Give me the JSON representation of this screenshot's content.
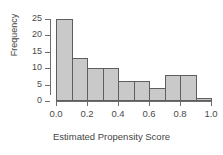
{
  "chart_data": {
    "type": "bar",
    "title": "",
    "subtitle": "",
    "xlabel": "Estimated Propensity Score",
    "ylabel": "Frequency",
    "grid": false,
    "legend": false,
    "legend_position": "none",
    "bin_width": 0.1,
    "bin_edges": [
      0.0,
      0.1,
      0.2,
      0.3,
      0.4,
      0.5,
      0.6,
      0.7,
      0.8,
      0.9,
      1.0
    ],
    "bin_centers": [
      0.05,
      0.15,
      0.25,
      0.35,
      0.45,
      0.55,
      0.65,
      0.75,
      0.85,
      0.95
    ],
    "categories": [
      "0.0-0.1",
      "0.1-0.2",
      "0.2-0.3",
      "0.3-0.4",
      "0.4-0.5",
      "0.5-0.6",
      "0.6-0.7",
      "0.7-0.8",
      "0.8-0.9",
      "0.9-1.0"
    ],
    "values": [
      25,
      13,
      10,
      10,
      6,
      6,
      4,
      8,
      8,
      1
    ],
    "xlim": [
      0.0,
      1.0
    ],
    "ylim": [
      0,
      25
    ],
    "xticks": [
      0.0,
      0.2,
      0.4,
      0.6,
      0.8,
      1.0
    ],
    "xtick_labels": [
      "0.0",
      "0.2",
      "0.4",
      "0.6",
      "0.8",
      "1.0"
    ],
    "yticks": [
      0,
      5,
      10,
      15,
      20,
      25
    ],
    "ytick_labels": [
      "0",
      "5",
      "10",
      "15",
      "20",
      "25"
    ],
    "bar_fill_color": "#c9c9c9",
    "bar_border_color": "#5e5e5e",
    "axis_color": "#6e6e6e",
    "text_color": "#4a4a4a",
    "background_color": "#ffffff"
  }
}
